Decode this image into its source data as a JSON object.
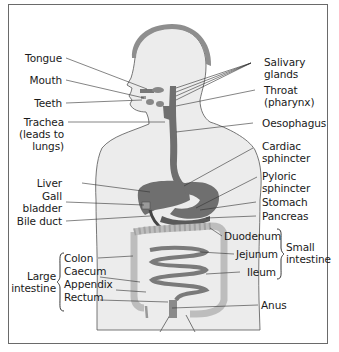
{
  "diagram": {
    "colors": {
      "body_fill": "#ececec",
      "hair": "#8e8e8e",
      "organ_dark": "#6f6f6f",
      "organ_mid": "#8a8a8a",
      "colon": "#bdbdbd",
      "border": "#6a6a6a",
      "text": "#1a1a1a"
    },
    "labels_left": {
      "tongue": "Tongue",
      "mouth": "Mouth",
      "teeth": "Teeth",
      "trachea_1": "Trachea",
      "trachea_2": "(leads to",
      "trachea_3": "lungs)",
      "liver": "Liver",
      "gall_1": "Gall",
      "gall_2": "bladder",
      "bile_duct": "Bile duct"
    },
    "labels_right": {
      "salivary_1": "Salivary",
      "salivary_2": "glands",
      "throat_1": "Throat",
      "throat_2": "(pharynx)",
      "oesophagus": "Oesophagus",
      "cardiac_1": "Cardiac",
      "cardiac_2": "sphincter",
      "pyloric_1": "Pyloric",
      "pyloric_2": "sphincter",
      "stomach": "Stomach",
      "pancreas": "Pancreas",
      "duodenum": "Duodenum",
      "jejunum": "Jejunum",
      "ileum": "Ileum",
      "anus": "Anus"
    },
    "groups": {
      "small_intestine_1": "Small",
      "small_intestine_2": "intestine",
      "large_intestine_1": "Large",
      "large_intestine_2": "intestine",
      "large_members": {
        "colon": "Colon",
        "caecum": "Caecum",
        "appendix": "Appendix",
        "rectum": "Rectum"
      }
    }
  }
}
